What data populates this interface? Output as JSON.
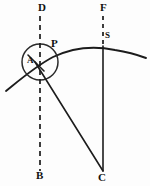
{
  "figure": {
    "type": "geometric-diagram",
    "background_color": "#fdfdfd",
    "ink_color": "#1c1c1c",
    "width": 150,
    "height": 186,
    "labels": {
      "d": "D",
      "f": "F",
      "s": "S",
      "p": "P",
      "a": "A",
      "b": "B",
      "c": "C"
    },
    "label_positions": {
      "d": {
        "x": 38,
        "y": 3
      },
      "f": {
        "x": 100,
        "y": 3
      },
      "s": {
        "x": 104,
        "y": 31
      },
      "p": {
        "x": 51,
        "y": 39
      },
      "a": {
        "x": 27,
        "y": 56
      },
      "b": {
        "x": 36,
        "y": 170
      },
      "c": {
        "x": 98,
        "y": 172
      }
    },
    "elements": [
      {
        "name": "arc-curve",
        "description": "large shallow arc rising left to right through P and S",
        "path": "M 6 91 C 22 78 36 66 53 57 C 74 47 96 46 115 50 C 128 52 138 55 146 58"
      },
      {
        "name": "construction-circle",
        "description": "small circle centered near A",
        "cx": 40,
        "cy": 62,
        "r": 18
      },
      {
        "name": "vertical-dashed-line-db",
        "description": "dashed vertical line from D at top to B at bottom",
        "x": 40,
        "y1": 16,
        "y2": 171
      },
      {
        "name": "vertical-line-fsc",
        "description": "dashed segment F to S then solid line S down to C",
        "x": 103,
        "dashed": {
          "y1": 16,
          "y2": 44
        },
        "solid": {
          "y1": 46,
          "y2": 171
        }
      },
      {
        "name": "radius-line-ac",
        "description": "straight line from A region down to C",
        "x1": 35,
        "y1": 62,
        "x2": 103,
        "y2": 171
      },
      {
        "name": "short-tick-a",
        "description": "short stroke through A marking the angle",
        "x1": 29,
        "y1": 55,
        "x2": 43,
        "y2": 70
      }
    ]
  }
}
